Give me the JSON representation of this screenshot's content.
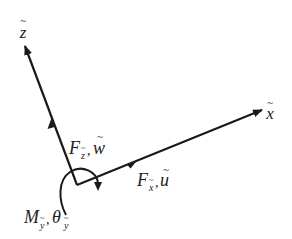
{
  "diagram": {
    "type": "2D local coordinate frame with force and moment components",
    "colors": {
      "stroke": "#1a1a1a",
      "text": "#222222",
      "background": "#ffffff"
    },
    "origin": {
      "x": 77,
      "y": 185
    },
    "axes": [
      {
        "id": "x",
        "label": "x",
        "accent": "~",
        "tip": {
          "x": 262,
          "y": 110
        }
      },
      {
        "id": "z",
        "label": "z",
        "accent": "~",
        "tip": {
          "x": 25,
          "y": 46
        }
      }
    ],
    "forces": [
      {
        "id": "Fx",
        "symbol": "F",
        "subscript": "x",
        "subscript_accent": "~",
        "dof": "u",
        "dof_accent": "~",
        "on_axis": "x"
      },
      {
        "id": "Fz",
        "symbol": "F",
        "subscript": "z",
        "subscript_accent": "~",
        "dof": "w",
        "dof_accent": "~",
        "on_axis": "z"
      }
    ],
    "moment": {
      "symbol": "M",
      "subscript": "y",
      "subscript_accent": "~",
      "dof": "θ",
      "dof_subscript": "y",
      "dof_subscript_accent": "~"
    },
    "separator": ","
  }
}
